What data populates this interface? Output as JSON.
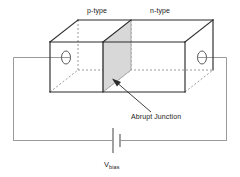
{
  "figure": {
    "labels": {
      "p_type": "p-type",
      "n_type": "n-type",
      "abrupt_junction": "Abrupt Junction",
      "vbias_symbol": "V",
      "vbias_subscript": "bias"
    },
    "colors": {
      "solid_edge": "#2b2b2b",
      "hidden_edge": "#8a8a8a",
      "junction_fill": "#d6d6d6",
      "junction_stroke": "#9a9a9a",
      "wire": "#9a9a9a",
      "battery": "#6e6e6e",
      "text": "#1a1a1a",
      "background": "#ffffff"
    },
    "geometry": {
      "box_front_left_x": 50,
      "box_front_right_x": 185,
      "box_front_top_y": 42,
      "box_front_bottom_y": 92,
      "depth_dx": 28,
      "depth_dy": -22,
      "junction_front_x": 103,
      "junction_back_x": 131
    },
    "elements": {
      "left_electrode": "left-contact-ellipse",
      "right_electrode": "right-contact-ellipse",
      "battery": "battery-symbol",
      "pointer": "junction-pointer-arrow"
    }
  }
}
